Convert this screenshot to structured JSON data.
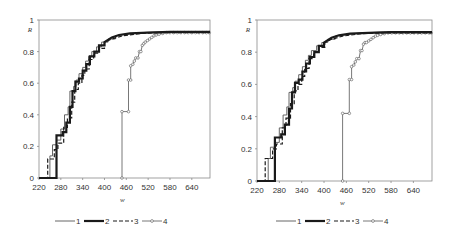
{
  "chart_data": [
    {
      "type": "line",
      "subtype": "step",
      "panel": "left",
      "title": "",
      "xlabel": "w",
      "ylabel": "R",
      "xlim": [
        220,
        690
      ],
      "ylim": [
        0,
        1
      ],
      "xticks": [
        "220",
        "280",
        "340",
        "400",
        "460",
        "520",
        "580",
        "640"
      ],
      "yticks": [
        "0",
        "0.2",
        "0.4",
        "0.6",
        "0.8",
        "1"
      ],
      "grid": false,
      "legend_position": "bottom",
      "series": [
        {
          "name": "1",
          "style": "thin-solid",
          "x": [
            220,
            250,
            250,
            257,
            257,
            268,
            268,
            280,
            280,
            290,
            290,
            300,
            300,
            305,
            305,
            315,
            315,
            322,
            322,
            330,
            330,
            340,
            340,
            348,
            348,
            356,
            356,
            365,
            365,
            378,
            378,
            392,
            392,
            410,
            410,
            430,
            430,
            460,
            500,
            560,
            690
          ],
          "y": [
            0,
            0,
            0.14,
            0.14,
            0.21,
            0.21,
            0.24,
            0.24,
            0.31,
            0.31,
            0.4,
            0.4,
            0.45,
            0.45,
            0.55,
            0.55,
            0.58,
            0.58,
            0.62,
            0.62,
            0.66,
            0.66,
            0.7,
            0.7,
            0.74,
            0.74,
            0.77,
            0.77,
            0.8,
            0.8,
            0.83,
            0.83,
            0.86,
            0.86,
            0.88,
            0.88,
            0.9,
            0.91,
            0.92,
            0.925,
            0.925
          ]
        },
        {
          "name": "2",
          "style": "thick-solid",
          "x": [
            220,
            268,
            268,
            285,
            285,
            295,
            295,
            305,
            305,
            312,
            312,
            320,
            320,
            330,
            330,
            340,
            340,
            350,
            350,
            360,
            360,
            372,
            372,
            385,
            385,
            400,
            400,
            420,
            440,
            470,
            520,
            580,
            690
          ],
          "y": [
            0,
            0,
            0.27,
            0.27,
            0.29,
            0.29,
            0.35,
            0.35,
            0.45,
            0.45,
            0.55,
            0.55,
            0.61,
            0.61,
            0.63,
            0.63,
            0.68,
            0.68,
            0.72,
            0.72,
            0.77,
            0.77,
            0.8,
            0.8,
            0.84,
            0.84,
            0.86,
            0.89,
            0.905,
            0.915,
            0.92,
            0.925,
            0.925
          ]
        },
        {
          "name": "3",
          "style": "dashed",
          "x": [
            220,
            244,
            244,
            262,
            262,
            272,
            272,
            288,
            288,
            298,
            298,
            310,
            310,
            318,
            318,
            328,
            328,
            338,
            338,
            346,
            346,
            358,
            358,
            370,
            370,
            384,
            384,
            400,
            400,
            420,
            450,
            500,
            560,
            690
          ],
          "y": [
            0,
            0,
            0.12,
            0.12,
            0.18,
            0.18,
            0.22,
            0.22,
            0.32,
            0.32,
            0.38,
            0.38,
            0.48,
            0.48,
            0.56,
            0.56,
            0.6,
            0.6,
            0.65,
            0.65,
            0.69,
            0.69,
            0.75,
            0.75,
            0.79,
            0.79,
            0.82,
            0.82,
            0.86,
            0.88,
            0.9,
            0.915,
            0.92,
            0.92
          ]
        },
        {
          "name": "4",
          "style": "thin-solid-circles",
          "x": [
            448,
            448,
            466,
            466,
            472,
            472,
            478,
            482,
            486,
            492,
            496,
            500,
            504,
            508,
            512,
            518,
            524,
            530,
            536,
            542,
            550,
            560,
            570,
            580,
            590,
            600,
            610,
            620,
            630,
            640,
            650,
            660,
            670,
            680,
            688
          ],
          "y": [
            0,
            0.42,
            0.42,
            0.62,
            0.62,
            0.71,
            0.72,
            0.74,
            0.76,
            0.76,
            0.8,
            0.8,
            0.84,
            0.85,
            0.86,
            0.87,
            0.88,
            0.89,
            0.9,
            0.905,
            0.91,
            0.915,
            0.92,
            0.92,
            0.92,
            0.92,
            0.92,
            0.92,
            0.92,
            0.92,
            0.92,
            0.92,
            0.92,
            0.92,
            0.92
          ]
        }
      ]
    },
    {
      "type": "line",
      "subtype": "step",
      "panel": "right",
      "title": "",
      "xlabel": "w",
      "ylabel": "R",
      "xlim": [
        220,
        690
      ],
      "ylim": [
        0,
        1
      ],
      "xticks": [
        "220",
        "280",
        "340",
        "400",
        "460",
        "520",
        "580",
        "640"
      ],
      "yticks": [
        "0",
        "0.2",
        "0.4",
        "0.6",
        "0.8",
        "1"
      ],
      "grid": false,
      "legend_position": "bottom",
      "series": [
        {
          "name": "1",
          "style": "thin-solid",
          "x": [
            220,
            250,
            250,
            256,
            256,
            268,
            268,
            280,
            280,
            290,
            290,
            300,
            300,
            306,
            306,
            316,
            316,
            322,
            322,
            332,
            332,
            342,
            342,
            350,
            350,
            358,
            358,
            366,
            366,
            380,
            380,
            394,
            394,
            410,
            410,
            430,
            430,
            460,
            500,
            560,
            690
          ],
          "y": [
            0,
            0,
            0.14,
            0.14,
            0.21,
            0.21,
            0.24,
            0.24,
            0.33,
            0.33,
            0.41,
            0.41,
            0.46,
            0.46,
            0.55,
            0.55,
            0.58,
            0.58,
            0.62,
            0.62,
            0.66,
            0.66,
            0.71,
            0.71,
            0.75,
            0.75,
            0.78,
            0.78,
            0.81,
            0.81,
            0.84,
            0.84,
            0.86,
            0.86,
            0.88,
            0.88,
            0.9,
            0.91,
            0.92,
            0.925,
            0.925
          ]
        },
        {
          "name": "2",
          "style": "thick-solid",
          "x": [
            220,
            268,
            268,
            285,
            285,
            295,
            295,
            306,
            306,
            314,
            314,
            322,
            322,
            332,
            332,
            342,
            342,
            352,
            352,
            362,
            362,
            374,
            374,
            386,
            386,
            400,
            400,
            420,
            440,
            470,
            520,
            580,
            690
          ],
          "y": [
            0,
            0,
            0.27,
            0.27,
            0.29,
            0.29,
            0.35,
            0.35,
            0.45,
            0.45,
            0.55,
            0.55,
            0.61,
            0.61,
            0.63,
            0.63,
            0.68,
            0.68,
            0.73,
            0.73,
            0.77,
            0.77,
            0.8,
            0.8,
            0.84,
            0.84,
            0.86,
            0.89,
            0.905,
            0.915,
            0.92,
            0.925,
            0.925
          ]
        },
        {
          "name": "3",
          "style": "dashed",
          "x": [
            220,
            242,
            242,
            262,
            262,
            272,
            272,
            288,
            288,
            298,
            298,
            310,
            310,
            320,
            320,
            330,
            330,
            340,
            340,
            348,
            348,
            360,
            360,
            372,
            372,
            386,
            386,
            402,
            402,
            420,
            450,
            500,
            560,
            690
          ],
          "y": [
            0,
            0,
            0.14,
            0.14,
            0.2,
            0.2,
            0.23,
            0.23,
            0.33,
            0.33,
            0.39,
            0.39,
            0.48,
            0.48,
            0.56,
            0.56,
            0.6,
            0.6,
            0.65,
            0.65,
            0.7,
            0.7,
            0.76,
            0.76,
            0.8,
            0.8,
            0.83,
            0.83,
            0.86,
            0.88,
            0.9,
            0.915,
            0.92,
            0.92
          ]
        },
        {
          "name": "4",
          "style": "thin-solid-circles",
          "x": [
            450,
            450,
            468,
            468,
            474,
            474,
            480,
            484,
            488,
            494,
            498,
            502,
            506,
            510,
            514,
            520,
            526,
            532,
            538,
            544,
            552,
            562,
            572,
            582,
            592,
            602,
            612,
            622,
            632,
            642,
            652,
            662,
            672,
            682,
            688
          ],
          "y": [
            0,
            0.42,
            0.42,
            0.63,
            0.63,
            0.71,
            0.72,
            0.74,
            0.76,
            0.76,
            0.81,
            0.81,
            0.85,
            0.86,
            0.86,
            0.87,
            0.88,
            0.89,
            0.9,
            0.905,
            0.91,
            0.915,
            0.92,
            0.92,
            0.92,
            0.92,
            0.92,
            0.92,
            0.92,
            0.92,
            0.92,
            0.92,
            0.92,
            0.92,
            0.92
          ]
        }
      ]
    }
  ],
  "panels": [
    {
      "id": "left",
      "plot_box": {
        "x": 39,
        "y": 20,
        "w": 171,
        "h": 158
      },
      "ylabel": "R",
      "xlabel": "w",
      "legend": {
        "x": 55,
        "y": 221
      }
    },
    {
      "id": "right",
      "plot_box": {
        "x": 257,
        "y": 20,
        "w": 175,
        "h": 161
      },
      "ylabel": "R",
      "xlabel": "w",
      "legend": {
        "x": 276,
        "y": 221
      }
    }
  ],
  "legend": {
    "items": [
      {
        "label": "1",
        "style": "thin-solid"
      },
      {
        "label": "2",
        "style": "thick-solid"
      },
      {
        "label": "3",
        "style": "dashed"
      },
      {
        "label": "4",
        "style": "thin-solid-circles"
      }
    ]
  },
  "colors": {
    "axis": "#8a8a8a",
    "line": "#1a1a1a",
    "thin_line": "#555555",
    "text": "#333333",
    "background": "#ffffff"
  }
}
